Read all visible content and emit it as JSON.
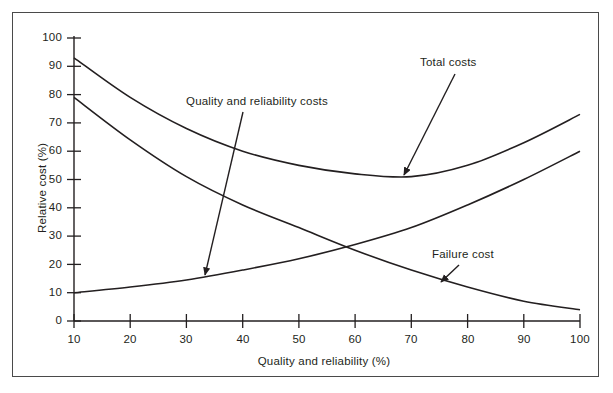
{
  "figure": {
    "background": "#ffffff",
    "frame_color": "#4a4a4a",
    "line_color": "#231f20"
  },
  "chart_data": {
    "type": "line",
    "title": "",
    "xlabel": "Quality and reliability (%)",
    "ylabel": "Relative cost (%)",
    "xlim": [
      10,
      100
    ],
    "ylim": [
      0,
      100
    ],
    "grid": false,
    "legend_position": "inline-annotations",
    "xticks": [
      10,
      20,
      30,
      40,
      50,
      60,
      70,
      80,
      90,
      100
    ],
    "xtick_labels": [
      "10",
      "20",
      "30",
      "40",
      "50",
      "60",
      "70",
      "80",
      "90",
      "100"
    ],
    "yticks": [
      0,
      10,
      20,
      30,
      40,
      50,
      60,
      70,
      80,
      90,
      100
    ],
    "ytick_labels": [
      "0",
      "10",
      "20",
      "30",
      "40",
      "50",
      "60",
      "70",
      "80",
      "90",
      "100"
    ],
    "x": [
      10,
      20,
      30,
      40,
      50,
      60,
      70,
      80,
      90,
      100
    ],
    "series": [
      {
        "name": "Total costs",
        "values": [
          93,
          79,
          68,
          60,
          55,
          52,
          51,
          55,
          63,
          73
        ]
      },
      {
        "name": "Quality and reliability costs",
        "values": [
          10,
          12,
          14.5,
          18,
          22,
          27,
          33,
          41,
          50,
          60
        ]
      },
      {
        "name": "Failure cost",
        "values": [
          79,
          64,
          51,
          41,
          33,
          25,
          18,
          12,
          7,
          4
        ]
      }
    ],
    "annotations": [
      {
        "label": "Total costs",
        "text_x": 420,
        "text_y": 56,
        "arrow_from_x": 455,
        "arrow_from_y": 74,
        "arrow_to_x": 402,
        "arrow_to_y": 177
      },
      {
        "label": "Quality and reliability costs",
        "text_x": 186,
        "text_y": 95,
        "arrow_from_x": 243,
        "arrow_from_y": 112,
        "arrow_to_x": 204,
        "arrow_to_y": 277
      },
      {
        "label": "Failure cost",
        "text_x": 432,
        "text_y": 248,
        "arrow_from_x": 459,
        "arrow_from_y": 265,
        "arrow_to_x": 440,
        "arrow_to_y": 283
      }
    ]
  }
}
